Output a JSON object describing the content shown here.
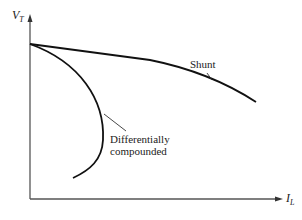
{
  "diagram": {
    "type": "characteristic-curves",
    "y_axis": {
      "label": "V",
      "subscript": "T"
    },
    "x_axis": {
      "label": "I",
      "subscript": "L"
    },
    "curves": [
      {
        "name": "shunt",
        "label": "Shunt"
      },
      {
        "name": "differentially-compounded",
        "label_line1": "Differentially",
        "label_line2": "compounded"
      }
    ]
  },
  "colors": {
    "line": "#111111",
    "axis": "#555555",
    "text": "#222222"
  }
}
